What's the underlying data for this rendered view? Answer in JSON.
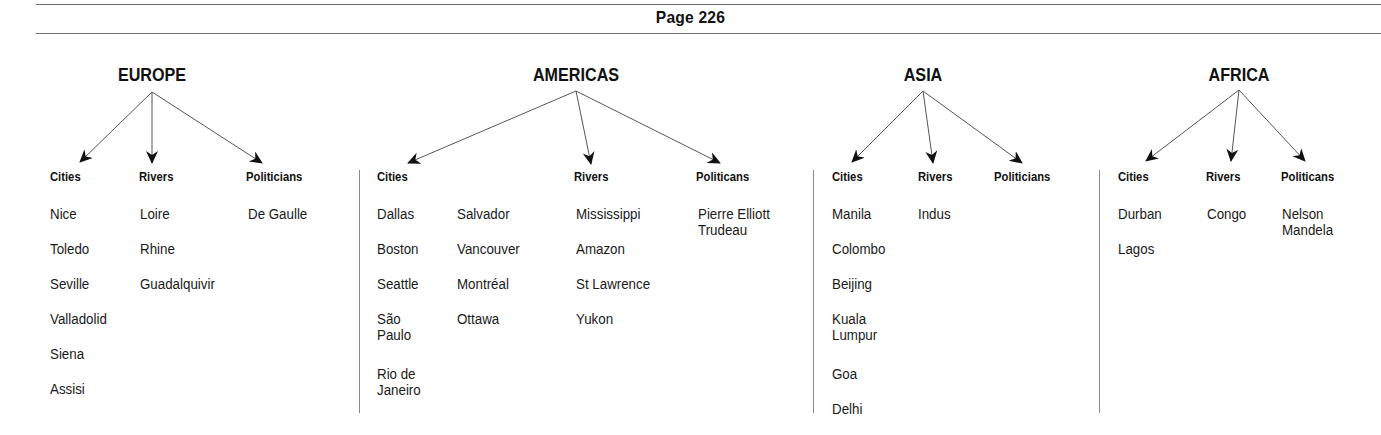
{
  "header": {
    "page_label": "Page 226"
  },
  "regions": {
    "europe": {
      "title": "EUROPE",
      "categories": [
        "Cities",
        "Rivers",
        "Politicians"
      ],
      "cities": [
        "Nice",
        "Toledo",
        "Seville",
        "Valladolid",
        "Siena",
        "Assisi"
      ],
      "rivers": [
        "Loire",
        "Rhine",
        "Guadalquivir"
      ],
      "politicians": [
        "De Gaulle"
      ]
    },
    "americas": {
      "title": "AMERICAS",
      "categories": [
        "Cities",
        "Rivers",
        "Politicans"
      ],
      "cities_col1": [
        "Dallas",
        "Boston",
        "Seattle",
        "São\nPaulo",
        "Rio de\nJaneiro"
      ],
      "cities_col2": [
        "Salvador",
        "Vancouver",
        "Montréal",
        "Ottawa"
      ],
      "rivers": [
        "Mississippi",
        "Amazon",
        "St Lawrence",
        "Yukon"
      ],
      "politicians": [
        "Pierre Elliott\nTrudeau"
      ]
    },
    "asia": {
      "title": "ASIA",
      "categories": [
        "Cities",
        "Rivers",
        "Politicians"
      ],
      "cities": [
        "Manila",
        "Colombo",
        "Beijing",
        "Kuala\nLumpur",
        "Goa",
        "Delhi"
      ],
      "rivers": [
        "Indus"
      ],
      "politicians": []
    },
    "africa": {
      "title": "AFRICA",
      "categories": [
        "Cities",
        "Rivers",
        "Politicans"
      ],
      "cities": [
        "Durban",
        "Lagos"
      ],
      "rivers": [
        "Congo"
      ],
      "politicians": [
        "Nelson\nMandela"
      ]
    }
  },
  "colors": {
    "text": "#1a1a1a",
    "rule": "#6e6e6e",
    "arrow": "#111111"
  }
}
